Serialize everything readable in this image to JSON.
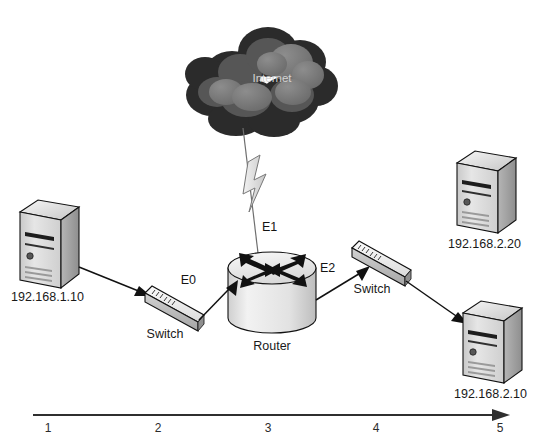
{
  "diagram": {
    "type": "network-topology"
  },
  "cloud": {
    "label": "Internet",
    "icon": "cloud-icon",
    "fill_dark": "#2e2e2e",
    "fill_mid": "#555555",
    "fill_light": "#7d7d7d",
    "text_color": "#d2d2d2"
  },
  "router": {
    "label": "Router",
    "icon": "router-icon",
    "interfaces": {
      "e0": "E0",
      "e1": "E1",
      "e2": "E2"
    }
  },
  "switches": [
    {
      "label": "Switch",
      "icon": "switch-icon",
      "position": "left"
    },
    {
      "label": "Switch",
      "icon": "switch-icon",
      "position": "right"
    }
  ],
  "hosts": [
    {
      "label": "192.168.1.10",
      "icon": "server-icon",
      "position": "left"
    },
    {
      "label": "192.168.2.20",
      "icon": "server-icon",
      "position": "top-right"
    },
    {
      "label": "192.168.2.10",
      "icon": "server-icon",
      "position": "bottom-right"
    }
  ],
  "links": [
    {
      "from": "192.168.1.10",
      "to": "left-switch",
      "style": "solid-arrow"
    },
    {
      "from": "left-switch",
      "to": "router-e0",
      "style": "solid-arrow"
    },
    {
      "from": "router-e1",
      "to": "Internet",
      "style": "wan-lightning"
    },
    {
      "from": "router-e2",
      "to": "right-switch",
      "style": "solid-arrow"
    },
    {
      "from": "right-switch",
      "to": "192.168.2.10",
      "style": "solid-arrow"
    }
  ],
  "axis": {
    "arrow_direction": "right",
    "ticks": [
      "1",
      "2",
      "3",
      "4",
      "5"
    ]
  },
  "colors": {
    "line": "#111111",
    "wan_line": "#6e6e6e",
    "axis": "#2f2f2f",
    "text": "#1a1a1a",
    "server_front": "#d9d9d9",
    "server_side": "#a8a8a8",
    "server_top": "#f0f0f0",
    "switch_top": "#ededed",
    "switch_front": "#bdbdbd",
    "router_body": "#e6e6e6"
  }
}
